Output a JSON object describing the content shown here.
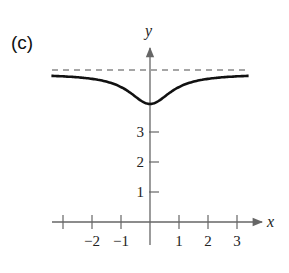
{
  "panel_label": "(c)",
  "chart_data": {
    "type": "line",
    "title": "",
    "xlabel": "x",
    "ylabel": "y",
    "x_ticks": [
      -3,
      -2,
      -1,
      1,
      2,
      3
    ],
    "x_tick_labels": [
      "-2",
      "-1",
      "1",
      "2",
      "3"
    ],
    "y_ticks": [
      1,
      2,
      3
    ],
    "y_tick_labels": [
      "1",
      "2",
      "3"
    ],
    "xlim": [
      -3.5,
      3.5
    ],
    "ylim": [
      0,
      5.5
    ],
    "asymptote": {
      "y": 5,
      "style": "dashed"
    },
    "series": [
      {
        "name": "f(x)",
        "x": [
          -3.5,
          -3,
          -2,
          -1.5,
          -1,
          -0.5,
          0,
          0.5,
          1,
          1.5,
          2,
          3,
          3.5
        ],
        "y": [
          4.92,
          4.9,
          4.8,
          4.69,
          4.5,
          4.2,
          4.0,
          4.2,
          4.5,
          4.69,
          4.8,
          4.9,
          4.92
        ]
      }
    ],
    "grid": false,
    "legend": null
  }
}
